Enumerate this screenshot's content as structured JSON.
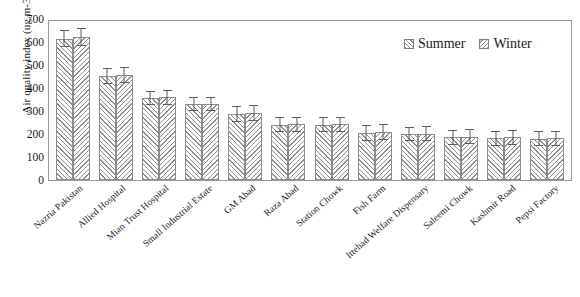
{
  "chart_data": {
    "type": "bar",
    "title": "",
    "xlabel": "",
    "ylabel": "Air quality index (ug.m-3)",
    "ylim": [
      0,
      700
    ],
    "ytick_interval": 100,
    "yticks": [
      "700",
      "600",
      "500",
      "400",
      "300",
      "200",
      "100",
      "0"
    ],
    "grid": false,
    "legend_position": "top-right",
    "error_bars": true,
    "categories": [
      "Nazria Pakistan",
      "Allied Hospital",
      "Mian Trust Hospital",
      "Small Industrial Estate",
      "GM Abad",
      "Raza Abad",
      "Station Chowk",
      "Fish Farm",
      "Ittehad Welfare Dispensary",
      "Saleemi Chowk",
      "Kashmir Road",
      "Pepsi Factory"
    ],
    "series": [
      {
        "name": "Summer",
        "values": [
          615,
          452,
          357,
          330,
          288,
          240,
          240,
          205,
          200,
          185,
          182,
          180
        ],
        "errors": [
          38,
          35,
          32,
          32,
          35,
          32,
          32,
          35,
          32,
          32,
          32,
          32
        ]
      },
      {
        "name": "Winter",
        "values": [
          622,
          455,
          360,
          330,
          290,
          242,
          242,
          208,
          202,
          188,
          185,
          182
        ],
        "errors": [
          38,
          35,
          32,
          32,
          35,
          32,
          32,
          35,
          32,
          32,
          32,
          32
        ]
      }
    ]
  },
  "legend": {
    "items": [
      {
        "label": "Summer",
        "pattern": "forward-diagonal-hatch"
      },
      {
        "label": "Winter",
        "pattern": "backward-diagonal-hatch"
      }
    ]
  },
  "colors": {
    "hatch": "#8f8f8f",
    "bar_border": "#8c8c8c",
    "error_bar": "#5d5d5d",
    "frame": "#9a9a9a",
    "text": "#1a1a1a",
    "background": "#ffffff"
  }
}
